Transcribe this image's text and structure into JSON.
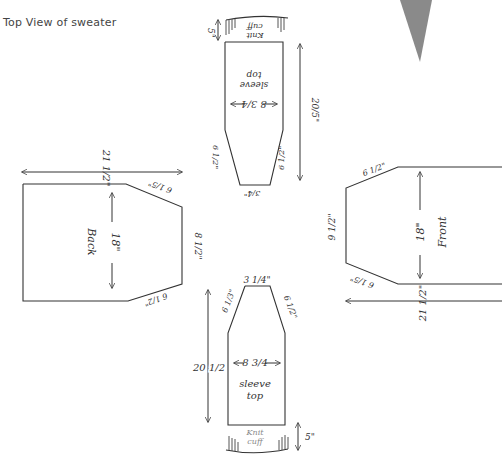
{
  "title": "Top View of sweater",
  "pieces": {
    "sleeve_top": {
      "label_top": "sleeve",
      "label_bottom": "top",
      "cuff_line1": "Knit",
      "cuff_line2": "cuff",
      "cuff_height": "5\"",
      "length": "20/5\"",
      "width": "8 3/4",
      "taper_left": "6 1/2\"",
      "taper_right": "6 1/2\"",
      "end_width": "3/4\""
    },
    "back": {
      "label": "Back",
      "width": "21 1/2\"",
      "height": "18\"",
      "shoulder_top": "6 1/5\"",
      "shoulder_bottom": "6 1/2\"",
      "side": "8 1/2\""
    },
    "front": {
      "label": "Front",
      "width": "21 1/2\"",
      "height": "18\"",
      "shoulder_top": "6 1/2\"",
      "shoulder_bottom": "6 1/5\"",
      "side": "9 1/2\""
    },
    "sleeve_bottom": {
      "label_top": "sleeve",
      "label_bottom": "top",
      "cuff_line1": "Knit",
      "cuff_line2": "cuff",
      "cuff_height": "5\"",
      "length": "20 1/2",
      "width": "8 3/4",
      "taper_left": "6 1/3\"",
      "taper_right": "6 1/2\"",
      "end_width": "3 1/4\""
    }
  },
  "colors": {
    "ink": "#333333",
    "wedge": "#8a8a8a"
  }
}
